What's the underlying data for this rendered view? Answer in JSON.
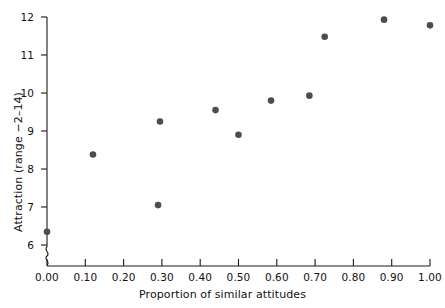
{
  "chart_data": {
    "type": "scatter",
    "title": "",
    "xlabel": "Proportion of similar attitudes",
    "ylabel": "Attraction (range −2–14)",
    "xlim": [
      0.0,
      1.05
    ],
    "ylim": [
      5.6,
      12.2
    ],
    "xticks": [
      0.0,
      0.1,
      0.2,
      0.3,
      0.4,
      0.5,
      0.6,
      0.7,
      0.8,
      0.9,
      1.0
    ],
    "xticklabels": [
      "0.00",
      "0.10",
      "0.20",
      "0.30",
      "0.40",
      "0.50",
      "0.60",
      "0.70",
      "0.80",
      "0.90",
      "1.00"
    ],
    "yticks": [
      6,
      7,
      8,
      9,
      10,
      11,
      12
    ],
    "yticklabels": [
      "6",
      "7",
      "8",
      "9",
      "10",
      "11",
      "12"
    ],
    "grid": false,
    "legend": null,
    "y_axis_break": true,
    "marker": {
      "shape": "circle",
      "color": "#4d4d4d",
      "size": 4.6
    },
    "x": [
      0.0,
      0.12,
      0.29,
      0.295,
      0.44,
      0.5,
      0.585,
      0.685,
      0.725,
      0.88,
      1.0
    ],
    "y": [
      6.35,
      8.38,
      7.05,
      9.25,
      9.55,
      8.9,
      9.8,
      9.93,
      11.48,
      11.93,
      11.78
    ],
    "points": [
      {
        "x": 0.0,
        "y": 6.35
      },
      {
        "x": 0.12,
        "y": 8.38
      },
      {
        "x": 0.29,
        "y": 7.05
      },
      {
        "x": 0.295,
        "y": 9.25
      },
      {
        "x": 0.44,
        "y": 9.55
      },
      {
        "x": 0.5,
        "y": 8.9
      },
      {
        "x": 0.585,
        "y": 9.8
      },
      {
        "x": 0.685,
        "y": 9.93
      },
      {
        "x": 0.725,
        "y": 11.48
      },
      {
        "x": 0.88,
        "y": 11.93
      },
      {
        "x": 1.0,
        "y": 11.78
      }
    ]
  },
  "axes": {
    "x_title": "Proportion of similar attitudes",
    "y_title": "Attraction (range −2–14)",
    "x_tick_labels": [
      "0.00",
      "0.10",
      "0.20",
      "0.30",
      "0.40",
      "0.50",
      "0.60",
      "0.70",
      "0.80",
      "0.90",
      "1.00"
    ],
    "y_tick_labels": [
      "6",
      "7",
      "8",
      "9",
      "10",
      "11",
      "12"
    ]
  },
  "colors": {
    "marker": "#4d4d4d",
    "axis": "#1a1a1a",
    "background": "#ffffff",
    "text": "#111111"
  }
}
